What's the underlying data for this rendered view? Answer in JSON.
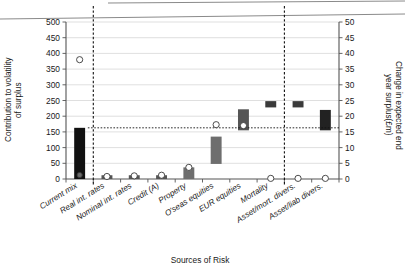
{
  "chart_data": {
    "type": "bar",
    "title": "",
    "subtitle": "",
    "xlabel": "Sources of Risk",
    "ylabel": "Contribution to volatility\nof surplus",
    "ylabel_right": "Change in expected end\nyear surplus(£m)",
    "categories": [
      "Current mix",
      "Real int. rates",
      "Nominal int. rates",
      "Credit (A)",
      "Property",
      "O'seas equities",
      "EUR equities",
      "Mortality",
      "Asset/mort. divers.",
      "Asset/liab divers."
    ],
    "ylim": [
      0,
      500
    ],
    "yticks": [
      0,
      50,
      100,
      150,
      200,
      250,
      300,
      350,
      400,
      450,
      500
    ],
    "ylim_right": [
      0,
      50
    ],
    "yticks_right": [
      0,
      5,
      10,
      15,
      20,
      25,
      30,
      35,
      40,
      45,
      50
    ],
    "grid": true,
    "legend": "none",
    "series": [
      {
        "name": "Contribution to volatility of surplus",
        "type": "floating-bar",
        "axis": "left",
        "bars": [
          {
            "category": "Current mix",
            "bottom": 0,
            "top": 163,
            "color": "#111111"
          },
          {
            "category": "Real int. rates",
            "bottom": 0,
            "top": 12,
            "color": "#555555"
          },
          {
            "category": "Nominal int. rates",
            "bottom": 0,
            "top": 12,
            "color": "#555555"
          },
          {
            "category": "Credit (A)",
            "bottom": 0,
            "top": 12,
            "color": "#555555"
          },
          {
            "category": "Property",
            "bottom": 0,
            "top": 37,
            "color": "#6e6e6e"
          },
          {
            "category": "O'seas equities",
            "bottom": 48,
            "top": 135,
            "color": "#6e6e6e"
          },
          {
            "category": "EUR equities",
            "bottom": 155,
            "top": 222,
            "color": "#555555"
          },
          {
            "category": "Mortality",
            "bottom": 228,
            "top": 248,
            "color": "#3a3a3a"
          },
          {
            "category": "Asset/mort. divers.",
            "bottom": 228,
            "top": 248,
            "color": "#3a3a3a"
          },
          {
            "category": "Asset/liab divers.",
            "bottom": 155,
            "top": 220,
            "color": "#222222"
          }
        ]
      },
      {
        "name": "Change in expected end year surplus (£m)",
        "type": "scatter",
        "axis": "right",
        "points": [
          {
            "category": "Current mix",
            "value": 38.0,
            "style": "open"
          },
          {
            "category": "Real int. rates",
            "value": 0.8,
            "style": "open"
          },
          {
            "category": "Nominal int. rates",
            "value": 1.0,
            "style": "open"
          },
          {
            "category": "Credit (A)",
            "value": 1.2,
            "style": "open"
          },
          {
            "category": "Property",
            "value": 3.7,
            "style": "open"
          },
          {
            "category": "O'seas equities",
            "value": 17.3,
            "style": "open"
          },
          {
            "category": "EUR equities",
            "value": 17.0,
            "style": "open"
          },
          {
            "category": "Mortality",
            "value": 0.2,
            "style": "open"
          },
          {
            "category": "Asset/mort. divers.",
            "value": 0.2,
            "style": "open"
          },
          {
            "category": "Asset/liab divers.",
            "value": 0.2,
            "style": "open"
          }
        ]
      }
    ],
    "annotations": {
      "reference_line": {
        "value": 163,
        "axis": "left",
        "style": "dotted-horizontal"
      },
      "separators": [
        {
          "after_category": "Current mix",
          "style": "dashed-vertical"
        },
        {
          "after_category": "Mortality",
          "style": "dashed-vertical"
        }
      ]
    }
  }
}
